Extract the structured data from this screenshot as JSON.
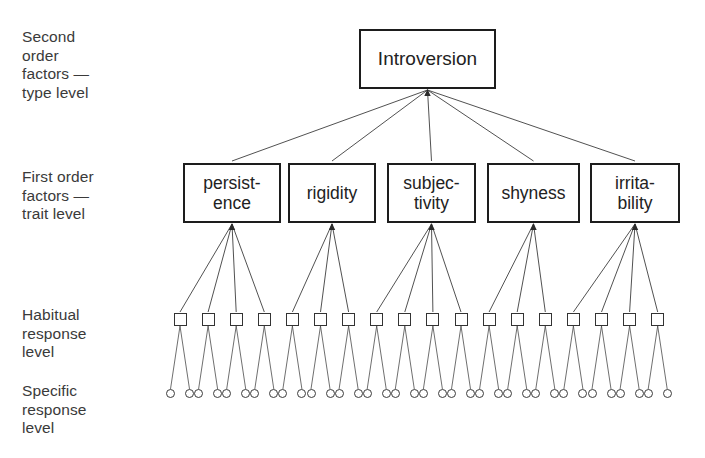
{
  "diagram": {
    "ink_color": "#2b2b2b",
    "background_color": "#ffffff"
  },
  "level_labels": [
    {
      "id": "second-order",
      "text": "Second\norder\nfactors —\ntype level"
    },
    {
      "id": "first-order",
      "text": "First order\nfactors —\ntrait level"
    },
    {
      "id": "habitual",
      "text": "Habitual\nresponse\nlevel"
    },
    {
      "id": "specific",
      "text": "Specific\nresponse\nlevel"
    }
  ],
  "type_level": {
    "label": "Introversion",
    "box": {
      "x": 359,
      "y": 29,
      "w": 137,
      "h": 60
    }
  },
  "trait_level": {
    "boxes": [
      {
        "id": "persistence",
        "label": "persist-\nence",
        "x": 183,
        "w": 98,
        "children": 4
      },
      {
        "id": "rigidity",
        "label": "rigidity",
        "x": 288,
        "w": 88,
        "children": 3
      },
      {
        "id": "subjectivity",
        "label": "subjec-\ntivity",
        "x": 387,
        "w": 89,
        "children": 4
      },
      {
        "id": "shyness",
        "label": "shyness",
        "x": 487,
        "w": 93,
        "children": 3
      },
      {
        "id": "irritability",
        "label": "irrita-\nbility",
        "x": 590,
        "w": 90,
        "children": 4
      }
    ],
    "box_y": 163,
    "box_h": 60
  },
  "habitual_level": {
    "count": 18,
    "square_size": 13,
    "y": 313,
    "first_x": 180,
    "spacing": 28.1,
    "children_per_square": 2
  },
  "specific_level": {
    "count": 36,
    "circle_size": 9,
    "y": 389,
    "pair_offset": 9.5
  }
}
